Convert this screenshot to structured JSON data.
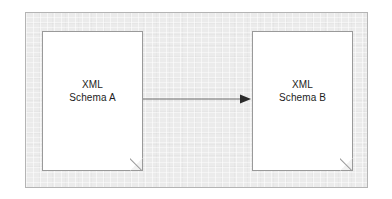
{
  "diagram": {
    "type": "flow",
    "background_color": "#ebebeb",
    "frame_border_color": "#b4b4b4",
    "nodes": [
      {
        "id": "schema-a",
        "shape": "document",
        "label": "XML\nSchema A",
        "line1": "XML",
        "line2": "Schema A",
        "fill_color": "#ffffff",
        "border_color": "#9a9a9a"
      },
      {
        "id": "schema-b",
        "shape": "document",
        "label": "XML\nSchema B",
        "line1": "XML",
        "line2": "Schema B",
        "fill_color": "#ffffff",
        "border_color": "#9a9a9a"
      }
    ],
    "edges": [
      {
        "id": "a-to-b",
        "from": "schema-a",
        "to": "schema-b",
        "label": "",
        "direction": "right",
        "arrowhead": "solid-triangle",
        "color": "#6e6e6e"
      }
    ]
  }
}
